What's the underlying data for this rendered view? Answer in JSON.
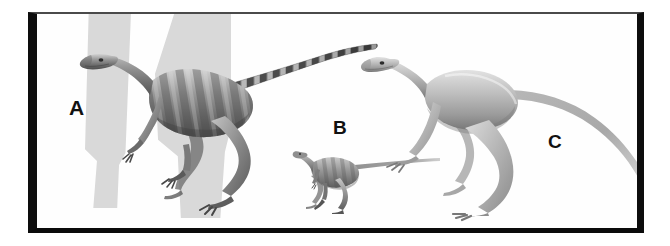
{
  "figure": {
    "kind": "comparative-anatomy-plate",
    "background_color": "#ffffff",
    "frame_color": "#0d0d0d",
    "shadow_color": "#d9d9d9",
    "panels": [
      {
        "id": "a",
        "label": "A",
        "subject": "theropod-dinosaur-large",
        "description": "largest striped theropod, left, long banded tail raised to the right",
        "body_tone": "#8e8e8e",
        "relative_size": "largest"
      },
      {
        "id": "b",
        "label": "B",
        "subject": "theropod-dinosaur-small",
        "description": "smallest theropod, center-low, very long thin tapering tail",
        "body_tone": "#909090",
        "relative_size": "smallest"
      },
      {
        "id": "c",
        "label": "C",
        "subject": "theropod-dinosaur-medium",
        "description": "pale medium theropod, right, long downward-sweeping tail",
        "body_tone": "#b4b4b4",
        "relative_size": "medium"
      }
    ]
  }
}
